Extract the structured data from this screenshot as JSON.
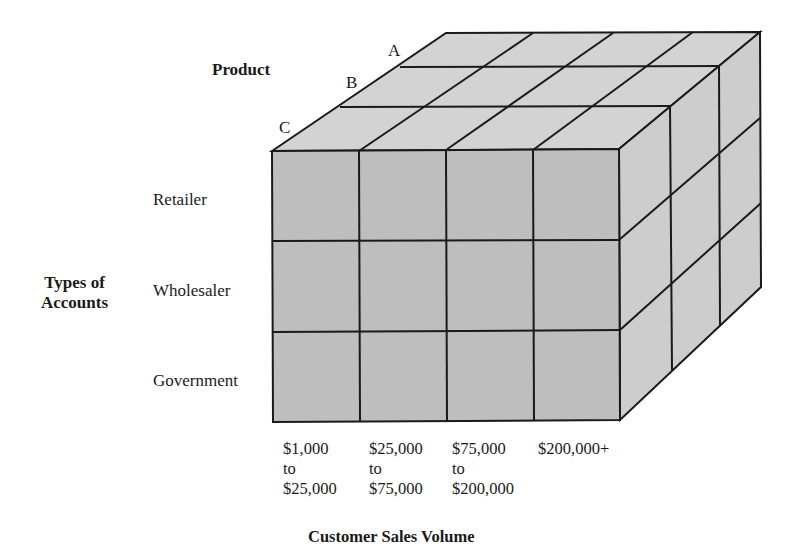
{
  "diagram": {
    "type": "data-cube",
    "dimension_labels": {
      "product": "Product",
      "accounts": "Types of Accounts",
      "accounts_line1": "Types of",
      "accounts_line2": "Accounts",
      "sales_volume": "Customer Sales Volume"
    },
    "products": [
      "A",
      "B",
      "C"
    ],
    "account_types": [
      "Retailer",
      "Wholesaler",
      "Government"
    ],
    "sales_volume_ranges": [
      {
        "line1": "$1,000",
        "line2": "to",
        "line3": "$25,000"
      },
      {
        "line1": "$25,000",
        "line2": "to",
        "line3": "$75,000"
      },
      {
        "line1": "$75,000",
        "line2": "to",
        "line3": "$200,000"
      },
      {
        "line1": "$200,000+",
        "line2": "",
        "line3": ""
      }
    ],
    "colors": {
      "front_face": "#bdbdbd",
      "top_face": "#d2d2d2",
      "side_face": "#cccccc",
      "edge": "#1a1a1a"
    }
  }
}
